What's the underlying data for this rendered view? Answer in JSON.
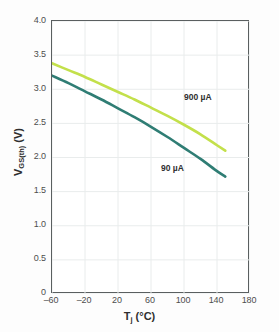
{
  "chart_data": {
    "type": "line",
    "title": "",
    "subtitle": "",
    "xlabel": "T_j (°C)",
    "ylabel": "V_GS(th) (V)",
    "xlim": [
      -60,
      180
    ],
    "ylim": [
      0,
      4.0
    ],
    "grid": true,
    "legend_position": "inline-annotation",
    "xticks": [
      -60,
      -20,
      20,
      60,
      100,
      140,
      180
    ],
    "xtick_labels": [
      "–60",
      "–20",
      "20",
      "60",
      "100",
      "140",
      "180"
    ],
    "yticks": [
      0,
      0.5,
      1.0,
      1.5,
      2.0,
      2.5,
      3.0,
      3.5,
      4.0
    ],
    "ytick_labels": [
      "0",
      "0.5",
      "1.0",
      "1.5",
      "2.0",
      "2.5",
      "3.0",
      "3.5",
      "4.0"
    ],
    "series": [
      {
        "name": "900 µA",
        "color": "#c3e04b",
        "x": [
          -60,
          -40,
          -20,
          0,
          20,
          40,
          60,
          80,
          100,
          120,
          140,
          150
        ],
        "values": [
          3.38,
          3.28,
          3.18,
          3.07,
          2.96,
          2.85,
          2.73,
          2.61,
          2.48,
          2.34,
          2.18,
          2.1
        ]
      },
      {
        "name": "90 µA",
        "color": "#2f7d74",
        "x": [
          -60,
          -40,
          -20,
          0,
          20,
          40,
          60,
          80,
          100,
          120,
          140,
          150
        ],
        "values": [
          3.2,
          3.09,
          2.97,
          2.85,
          2.72,
          2.59,
          2.45,
          2.3,
          2.14,
          1.98,
          1.8,
          1.72
        ]
      }
    ],
    "annotations": [
      {
        "text": "900 µA",
        "series": "900 µA"
      },
      {
        "text": "90 µA",
        "series": "90 µA"
      }
    ]
  },
  "axis": {
    "x_title_main": "T",
    "x_title_sub": "j",
    "x_title_unit": " (°C)",
    "y_title_main": "V",
    "y_title_sub": "GS(th)",
    "y_title_unit": " (V)"
  },
  "colors": {
    "series_900": "#c3e04b",
    "series_90": "#2f7d74",
    "frame": "#5a5f60",
    "grid": "#e9ecec",
    "text": "#4d4d4d",
    "background": "#fdfdfd"
  }
}
